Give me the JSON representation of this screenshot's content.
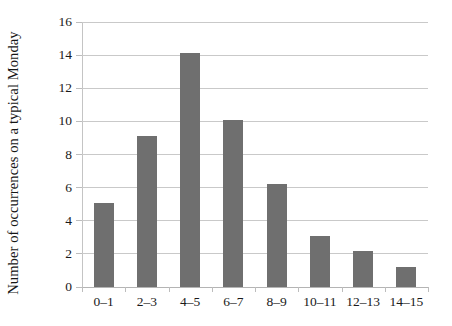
{
  "chart_data": {
    "type": "bar",
    "title": "",
    "subtitle": "",
    "xlabel": "",
    "ylabel": "Number of occurrences on a typical Monday",
    "categories": [
      "0–1",
      "2–3",
      "4–5",
      "6–7",
      "8–9",
      "10–11",
      "12–13",
      "14–15"
    ],
    "values": [
      5.1,
      9.1,
      14.1,
      10.1,
      6.2,
      3.1,
      2.2,
      1.2
    ],
    "ylim": [
      0,
      16
    ],
    "yticks": [
      0,
      2,
      4,
      6,
      8,
      10,
      12,
      14,
      16
    ],
    "ytick_labels": [
      "0",
      "2",
      "4",
      "6",
      "8",
      "10",
      "12",
      "14",
      "16"
    ],
    "grid": true,
    "legend": false,
    "bar_color": "#6f6f6f",
    "grid_color": "#c9c9c9",
    "axis_color": "#c4c4c4",
    "background": "#ffffff"
  }
}
